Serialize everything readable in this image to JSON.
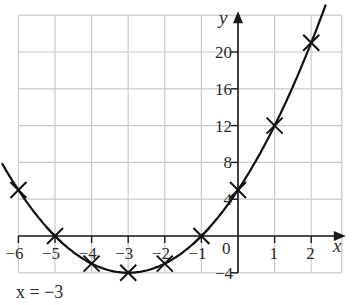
{
  "chart_data": {
    "type": "line",
    "title": "",
    "function": "y = x^2 + 6x + 5",
    "xlabel": "x",
    "ylabel": "y",
    "xlim": [
      -6,
      3
    ],
    "ylim": [
      -4,
      24
    ],
    "grid": true,
    "x_ticks": [
      -6,
      -5,
      -4,
      -3,
      -2,
      -1,
      0,
      1,
      2
    ],
    "x_tick_labels": [
      "−6",
      "−5",
      "−4",
      "−3",
      "−2",
      "−1",
      "0",
      "1",
      "2"
    ],
    "y_ticks": [
      -4,
      4,
      8,
      12,
      16,
      20
    ],
    "y_tick_labels": [
      "−4",
      "4",
      "8",
      "12",
      "16",
      "20"
    ],
    "series": [
      {
        "name": "y = x² + 6x + 5",
        "x": [
          -6,
          -5,
          -4,
          -3,
          -2,
          -1,
          0,
          1,
          2
        ],
        "y": [
          5,
          0,
          -3,
          -4,
          -3,
          0,
          5,
          12,
          21
        ],
        "marker": "x"
      }
    ],
    "annotations": [
      {
        "text": "x = −3",
        "meaning": "axis of symmetry"
      }
    ]
  },
  "labels": {
    "x_axis": "x",
    "y_axis": "y",
    "origin": "0",
    "symmetry_note": "x = −3"
  }
}
